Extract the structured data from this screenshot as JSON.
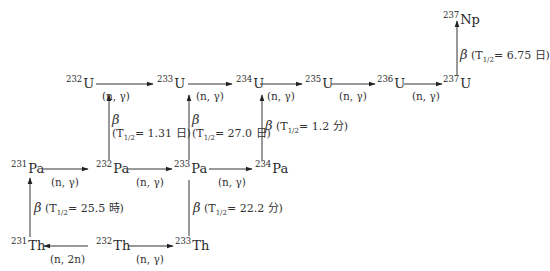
{
  "diagram": {
    "nuclides": [
      {
        "id": "Np237",
        "mass": "237",
        "symbol": "Np",
        "x": 443,
        "y": 12
      },
      {
        "id": "U232",
        "mass": "232",
        "symbol": "U",
        "x": 66,
        "y": 72
      },
      {
        "id": "U233",
        "mass": "233",
        "symbol": "U",
        "x": 160,
        "y": 72
      },
      {
        "id": "U234",
        "mass": "234",
        "symbol": "U",
        "x": 238,
        "y": 72
      },
      {
        "id": "U235",
        "mass": "235",
        "symbol": "U",
        "x": 305,
        "y": 75
      },
      {
        "id": "U236",
        "mass": "236",
        "symbol": "U",
        "x": 377,
        "y": 75
      },
      {
        "id": "U237",
        "mass": "237",
        "symbol": "U",
        "x": 443,
        "y": 75
      },
      {
        "id": "Pa231",
        "mass": "231",
        "symbol": "Pa",
        "x": 11,
        "y": 156
      },
      {
        "id": "Pa232",
        "mass": "232",
        "symbol": "Pa",
        "x": 97,
        "y": 156
      },
      {
        "id": "Pa233",
        "mass": "233",
        "symbol": "Pa",
        "x": 177,
        "y": 156
      },
      {
        "id": "Pa234",
        "mass": "234",
        "symbol": "Pa",
        "x": 256,
        "y": 156
      },
      {
        "id": "Th231",
        "mass": "231",
        "symbol": "Th",
        "x": 11,
        "y": 232
      },
      {
        "id": "Th232",
        "mass": "232",
        "symbol": "Th",
        "x": 97,
        "y": 232
      },
      {
        "id": "Th233",
        "mass": "233",
        "symbol": "Th",
        "x": 177,
        "y": 232
      }
    ],
    "reactions": [
      {
        "from": "U232",
        "to": "U233",
        "label": "(n, γ)",
        "x": 98,
        "y": 94
      },
      {
        "from": "U233",
        "to": "U234",
        "label": "(n, γ)",
        "x": 178,
        "y": 94
      },
      {
        "from": "U234",
        "to": "U235",
        "label": "(n, γ)",
        "x": 258,
        "y": 94
      },
      {
        "from": "U235",
        "to": "U236",
        "label": "(n, γ)",
        "x": 336,
        "y": 94
      },
      {
        "from": "U236",
        "to": "U237",
        "label": "(n, γ)",
        "x": 408,
        "y": 94
      },
      {
        "from": "Pa231",
        "to": "Pa232",
        "label": "(n, γ)",
        "x": 50,
        "y": 180
      },
      {
        "from": "Pa232",
        "to": "Pa233",
        "label": "(n, γ)",
        "x": 136,
        "y": 180
      },
      {
        "from": "Pa233",
        "to": "Pa234",
        "label": "(n, γ)",
        "x": 215,
        "y": 180
      },
      {
        "from": "Th232",
        "to": "Th231",
        "label": "(n, 2n)",
        "x": 50,
        "y": 255
      },
      {
        "from": "Th232",
        "to": "Th233",
        "label": "(n, γ)",
        "x": 136,
        "y": 255
      }
    ],
    "decays": [
      {
        "from": "Pa232",
        "to": "U232",
        "symbol": "β",
        "prefix": "(T",
        "sub": "1/2",
        "value": "= 1.31 日)",
        "two_line": true,
        "x": 105,
        "y": 115
      },
      {
        "from": "Pa233",
        "to": "U233",
        "symbol": "β",
        "prefix": "(T",
        "sub": "1/2",
        "value": "= 27.0 日)",
        "two_line": true,
        "x": 192,
        "y": 115
      },
      {
        "from": "Pa234",
        "to": "U234",
        "symbol": "β",
        "prefix": "(T",
        "sub": "1/2",
        "value": "= 1.2 分)",
        "two_line": false,
        "x": 265,
        "y": 121
      },
      {
        "from": "U237",
        "to": "Np237",
        "symbol": "β",
        "prefix": "(T",
        "sub": "1/2",
        "value": "= 6.75 日)",
        "two_line": false,
        "x": 460,
        "y": 52
      },
      {
        "from": "Th231",
        "to": "Pa231",
        "symbol": "β",
        "prefix": "(T",
        "sub": "1/2",
        "value": "= 25.5 時)",
        "two_line": false,
        "x": 34,
        "y": 202
      },
      {
        "from": "Th233",
        "to": "Pa233",
        "symbol": "β",
        "prefix": "(T",
        "sub": "1/2",
        "value": "= 22.2 分)",
        "two_line": false,
        "x": 191,
        "y": 203
      }
    ]
  }
}
